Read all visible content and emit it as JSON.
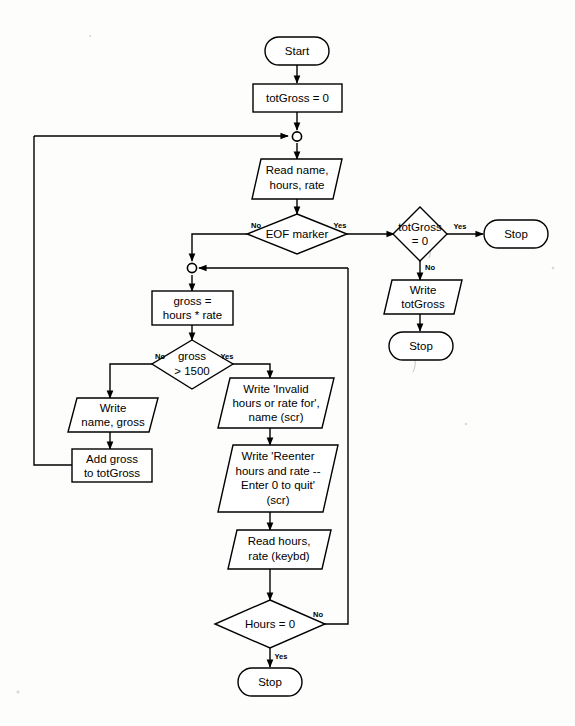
{
  "diagram": {
    "colors": {
      "background": "#fdfdfc",
      "stroke": "#000000",
      "shape_fill": "#ffffff"
    },
    "nodes": {
      "start": {
        "label": "Start",
        "shape": "terminator"
      },
      "init_totgross": {
        "label": "totGross = 0",
        "shape": "process"
      },
      "read_record": {
        "line1": "Read name,",
        "line2": "hours, rate",
        "shape": "io"
      },
      "eof_decision": {
        "label": "EOF marker",
        "shape": "decision"
      },
      "totgross_zero_decision": {
        "line1": "totGross",
        "line2": "= 0",
        "shape": "decision"
      },
      "stop_top": {
        "label": "Stop",
        "shape": "terminator"
      },
      "write_totgross": {
        "line1": "Write",
        "line2": "totGross",
        "shape": "io"
      },
      "stop_after_write": {
        "label": "Stop",
        "shape": "terminator"
      },
      "compute_gross": {
        "line1": "gross =",
        "line2": "hours * rate",
        "shape": "process"
      },
      "gross_decision": {
        "line1": "gross",
        "line2": "> 1500",
        "shape": "decision"
      },
      "write_name_gross": {
        "line1": "Write",
        "line2": "name, gross",
        "shape": "io"
      },
      "add_gross": {
        "line1": "Add gross",
        "line2": "to totGross",
        "shape": "process"
      },
      "write_invalid": {
        "line1": "Write 'Invalid",
        "line2": "hours or rate for',",
        "line3": "name (scr)",
        "shape": "io"
      },
      "write_reenter": {
        "line1": "Write 'Reenter",
        "line2": "hours and rate --",
        "line3": "Enter 0 to quit'",
        "line4": "(scr)",
        "shape": "io"
      },
      "read_hours_rate": {
        "line1": "Read hours,",
        "line2": "rate  (keybd)",
        "shape": "io"
      },
      "hours_decision": {
        "label": "Hours = 0",
        "shape": "decision"
      },
      "stop_bottom": {
        "label": "Stop",
        "shape": "terminator"
      }
    },
    "branch_labels": {
      "eof_no": "No",
      "eof_yes": "Yes",
      "totgross_yes": "Yes",
      "totgross_no": "No",
      "gross_no": "No",
      "gross_yes": "Yes",
      "hours_no": "No",
      "hours_yes": "Yes"
    }
  }
}
